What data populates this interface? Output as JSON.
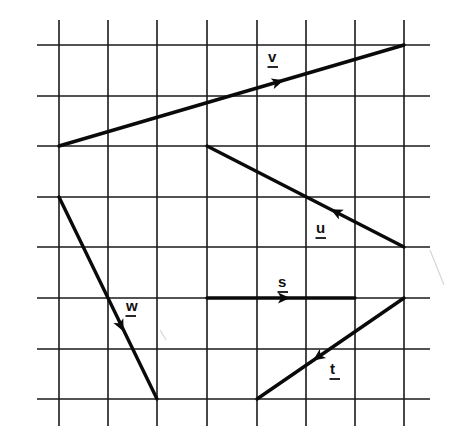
{
  "diagram": {
    "type": "vector-grid",
    "grid": {
      "columns": 7,
      "rows": 7,
      "x_lines": [
        59,
        108,
        157,
        207,
        257,
        306,
        355,
        404
      ],
      "y_lines": [
        45,
        96,
        146,
        197,
        247,
        298,
        349,
        399
      ],
      "v_extent": [
        20,
        426
      ],
      "h_extent": [
        37,
        430
      ],
      "line_color": "#1a1a1a"
    },
    "vectors": [
      {
        "name": "v",
        "label": "v",
        "from": {
          "col": 0,
          "row": 2
        },
        "to": {
          "col": 7,
          "row": 0
        },
        "components": {
          "dx": 7,
          "dy": 2
        },
        "start_px": [
          59,
          146
        ],
        "end_px": [
          404,
          45
        ],
        "arrow_px": [
          278,
          82
        ],
        "label_px": [
          268,
          62
        ],
        "direction": "up-right"
      },
      {
        "name": "u",
        "label": "u",
        "from": {
          "col": 7,
          "row": 4
        },
        "to": {
          "col": 3,
          "row": 2
        },
        "components": {
          "dx": -4,
          "dy": 2
        },
        "start_px": [
          404,
          247
        ],
        "end_px": [
          207,
          146
        ],
        "arrow_px": [
          336,
          212
        ],
        "label_px": [
          316,
          233
        ],
        "direction": "up-left"
      },
      {
        "name": "w",
        "label": "w",
        "from": {
          "col": 0,
          "row": 3
        },
        "to": {
          "col": 2,
          "row": 7
        },
        "components": {
          "dx": 2,
          "dy": -4
        },
        "start_px": [
          59,
          197
        ],
        "end_px": [
          157,
          399
        ],
        "arrow_px": [
          121,
          326
        ],
        "label_px": [
          126,
          311
        ],
        "direction": "down-right"
      },
      {
        "name": "s",
        "label": "s",
        "from": {
          "col": 3,
          "row": 5
        },
        "to": {
          "col": 6,
          "row": 5
        },
        "components": {
          "dx": 3,
          "dy": 0
        },
        "start_px": [
          207,
          298
        ],
        "end_px": [
          355,
          298
        ],
        "arrow_px": [
          284,
          298
        ],
        "label_px": [
          278,
          287
        ],
        "direction": "right"
      },
      {
        "name": "t",
        "label": "t",
        "from": {
          "col": 7,
          "row": 5
        },
        "to": {
          "col": 4,
          "row": 7
        },
        "components": {
          "dx": -3,
          "dy": -2
        },
        "start_px": [
          404,
          298
        ],
        "end_px": [
          257,
          399
        ],
        "arrow_px": [
          318,
          357
        ],
        "label_px": [
          330,
          374
        ],
        "direction": "down-left"
      }
    ],
    "colors": {
      "background": "#ffffff",
      "ink": "#0a0a0a"
    }
  }
}
